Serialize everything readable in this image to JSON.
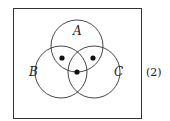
{
  "diagram": {
    "type": "venn",
    "sets": [
      {
        "label": "A",
        "cx": 77,
        "cy": 46,
        "r": 26
      },
      {
        "label": "B",
        "cx": 61,
        "cy": 72,
        "r": 26
      },
      {
        "label": "C",
        "cx": 94,
        "cy": 72,
        "r": 26
      }
    ],
    "dots": [
      {
        "region": "A∩B",
        "x": 62,
        "y": 58
      },
      {
        "region": "A∩C",
        "x": 93,
        "y": 58
      },
      {
        "region": "A∩B∩C",
        "x": 77,
        "y": 72
      }
    ],
    "equation_number": "(2)",
    "colors": {
      "stroke": "#333333",
      "dot": "#111111"
    }
  }
}
